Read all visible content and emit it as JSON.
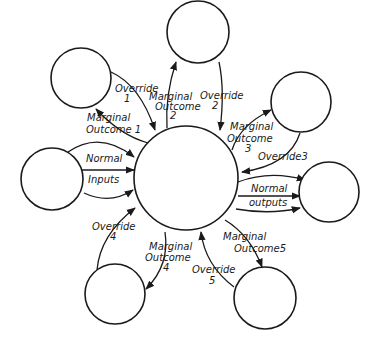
{
  "diagram": {
    "center": {
      "id": "central-process"
    },
    "nodes": [
      {
        "id": "node-top-left"
      },
      {
        "id": "node-top"
      },
      {
        "id": "node-top-right"
      },
      {
        "id": "node-left"
      },
      {
        "id": "node-right"
      },
      {
        "id": "node-bottom-left"
      },
      {
        "id": "node-bottom-right"
      }
    ],
    "labels": {
      "override1": {
        "line1": "Override",
        "line2": "1"
      },
      "marginal1": {
        "line1": "Marginal",
        "line2": "Outcome 1"
      },
      "marginal2": {
        "line1": "Marginal",
        "line2": "Outcome",
        "line3": "2"
      },
      "override2": {
        "line1": "Override",
        "line2": "2"
      },
      "marginal3": {
        "line1": "Marginal",
        "line2": "Outcome",
        "line3": "3"
      },
      "override3": {
        "line1": "Override3"
      },
      "normal_inputs": {
        "line1": "Normal",
        "line2": "Inputs"
      },
      "normal_outputs": {
        "line1": "Normal",
        "line2": "outputs"
      },
      "override4": {
        "line1": "Override",
        "line2": "4"
      },
      "marginal4": {
        "line1": "Marginal",
        "line2": "Outcome",
        "line3": "4"
      },
      "override5": {
        "line1": "Override",
        "line2": "5"
      },
      "marginal5": {
        "line1": "Marginal",
        "line2": "Outcome5"
      }
    }
  }
}
